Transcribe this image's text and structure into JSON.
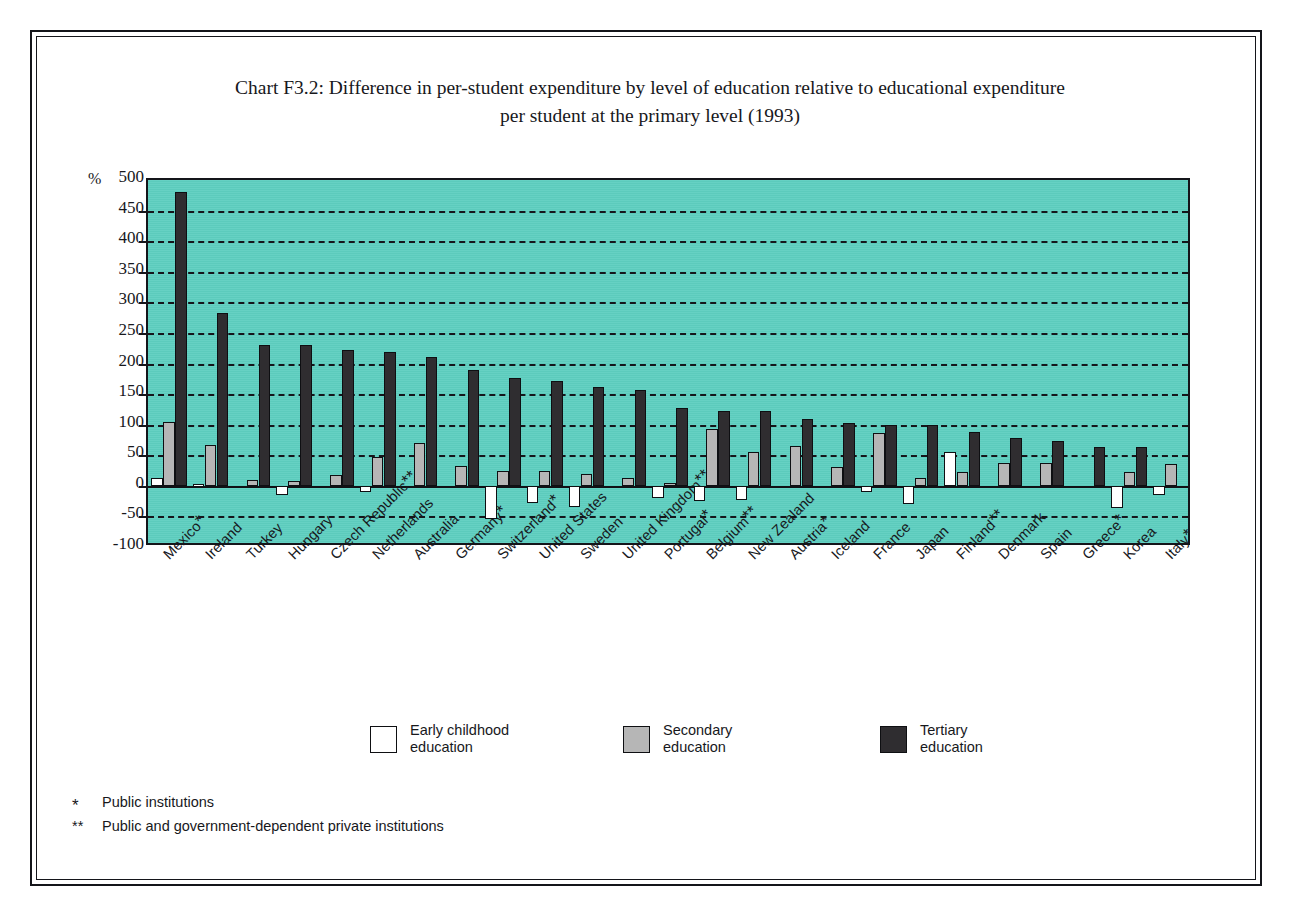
{
  "page": {
    "top_text_fragment": "",
    "background": "#ffffff",
    "frame_color": "#14151a"
  },
  "chart_data": {
    "type": "bar",
    "title": "Chart F3.2: Difference in per-student expenditure by level of education relative to educational expenditure per student at the primary level (1993)",
    "title_line1": "Chart F3.2: Difference in per-student expenditure by level of education relative to educational expenditure",
    "title_line2": "per student at the primary level (1993)",
    "xlabel": "",
    "ylabel": "%",
    "ylim": [
      -100,
      500
    ],
    "ytick_step": 50,
    "yticks": [
      500,
      450,
      400,
      350,
      300,
      250,
      200,
      150,
      100,
      50,
      0,
      -50,
      -100
    ],
    "ytick_labels": [
      "500",
      "450",
      "400",
      "350",
      "300",
      "250",
      "200",
      "150",
      "100",
      "50",
      "0",
      "-50",
      "-100"
    ],
    "grid": true,
    "grid_style": "dashed",
    "legend_position": "bottom",
    "plot_background": "#5ecfc0",
    "categories": [
      "Mexico*",
      "Ireland",
      "Turkey",
      "Hungary",
      "Czech Republic**",
      "Netherlands",
      "Australia",
      "Germany*",
      "Switzerland*",
      "United States",
      "Sweden",
      "United Kingdom**",
      "Portugal*",
      "Belgium**",
      "New Zealand",
      "Austria*",
      "Iceland",
      "France",
      "Japan",
      "Finland**",
      "Denmark",
      "Spain",
      "Greece*",
      "Korea",
      "Italy*"
    ],
    "category_names": [
      "Mexico",
      "Ireland",
      "Turkey",
      "Hungary",
      "Czech Republic",
      "Netherlands",
      "Australia",
      "Germany",
      "Switzerland",
      "United States",
      "Sweden",
      "United Kingdom",
      "Portugal",
      "Belgium",
      "New Zealand",
      "Austria",
      "Iceland",
      "France",
      "Japan",
      "Finland",
      "Denmark",
      "Spain",
      "Greece",
      "Korea",
      "Italy"
    ],
    "category_marks": [
      "*",
      "",
      "",
      "",
      "**",
      "",
      "",
      "*",
      "*",
      "",
      "",
      "**",
      "*",
      "**",
      "",
      "*",
      "",
      "",
      "",
      "**",
      "",
      "",
      "*",
      "",
      "*"
    ],
    "series": [
      {
        "name": "Early childhood education",
        "color": "#ffffff",
        "values": [
          13,
          3,
          0,
          -15,
          0,
          -10,
          0,
          0,
          -55,
          -28,
          -35,
          0,
          -20,
          -25,
          -23,
          0,
          0,
          -10,
          -30,
          55,
          0,
          0,
          0,
          -37,
          -15
        ]
      },
      {
        "name": "Secondary education",
        "color": "#b6b6b6",
        "values": [
          105,
          67,
          10,
          8,
          17,
          47,
          70,
          32,
          25,
          25,
          20,
          13,
          5,
          93,
          55,
          65,
          30,
          87,
          13,
          22,
          38,
          37,
          0,
          23,
          35
        ]
      },
      {
        "name": "Tertiary education",
        "color": "#2f2d30",
        "values": [
          480,
          282,
          230,
          230,
          222,
          218,
          210,
          190,
          177,
          171,
          162,
          157,
          127,
          122,
          123,
          110,
          102,
          100,
          100,
          88,
          78,
          73,
          63,
          63,
          0
        ]
      }
    ],
    "annotations": [],
    "footnotes": [
      {
        "marker": "*",
        "text": "Public institutions"
      },
      {
        "marker": "**",
        "text": "Public and government-dependent private institutions"
      }
    ]
  },
  "legend": {
    "items": [
      {
        "label_line1": "Early childhood",
        "label_line2": "education",
        "swatch": "early-childhood-swatch"
      },
      {
        "label_line1": "Secondary",
        "label_line2": "education",
        "swatch": "secondary-swatch"
      },
      {
        "label_line1": "Tertiary",
        "label_line2": "education",
        "swatch": "tertiary-swatch"
      }
    ]
  }
}
